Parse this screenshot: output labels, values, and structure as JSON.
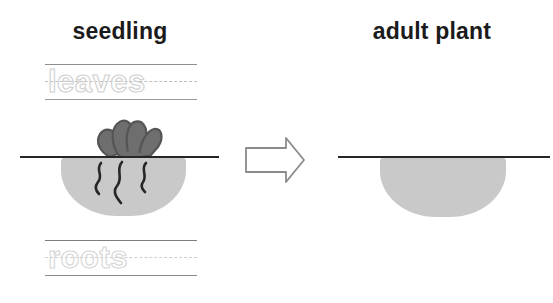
{
  "worksheet": {
    "title": "Plant life cycle — seedling to adult plant",
    "background_color": "#ffffff"
  },
  "headings": {
    "left": "seedling",
    "right": "adult plant"
  },
  "tracing": {
    "leaves": {
      "word": "leaves",
      "label": "leaves-tracing-word",
      "guide_lines": 3,
      "style": "dotted-trace"
    },
    "roots": {
      "word": "roots",
      "label": "roots-tracing-word",
      "guide_lines": 3,
      "style": "dotted-trace"
    }
  },
  "diagram": {
    "seedling": {
      "has_leaves": true,
      "has_roots": true,
      "root_count": 3,
      "leaf_lobe_count": 4,
      "soil_color": "#c9c9c9",
      "leaf_color": "#6e6e6e",
      "leaf_outline_color": "#555555",
      "root_color": "#262626",
      "ground_line_color": "#262626"
    },
    "adult_plant": {
      "has_leaves": false,
      "has_roots": false,
      "soil_color": "#c9c9c9",
      "ground_line_color": "#262626"
    }
  },
  "arrow": {
    "direction": "right",
    "label": "transformation-arrow",
    "fill": "#ffffff",
    "stroke": "#8a8a8a"
  },
  "colors": {
    "text": "#1b1b1b",
    "guide_solid": "#8e8e8e",
    "guide_dashed": "#bdbdbd",
    "trace_stroke": "#cfcfcf"
  }
}
